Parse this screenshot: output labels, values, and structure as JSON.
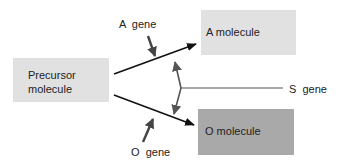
{
  "diagram": {
    "nodes": {
      "precursor": {
        "line1": "Precursor",
        "line2": "molecule",
        "fill": "#e1e1e1"
      },
      "a_molecule": {
        "label": "A molecule",
        "fill": "#e1e1e1"
      },
      "o_molecule": {
        "label": "O molecule",
        "fill": "#a9a9a9"
      }
    },
    "gene_labels": {
      "a_gene": "A  gene",
      "o_gene": "O  gene",
      "s_gene": "S  gene"
    },
    "edges": [
      {
        "from": "precursor",
        "to": "a_molecule",
        "modifier": "A gene"
      },
      {
        "from": "precursor",
        "to": "o_molecule",
        "modifier": "O gene"
      },
      {
        "from": "S gene",
        "to": "A pathway",
        "type": "influence"
      },
      {
        "from": "S gene",
        "to": "O pathway",
        "type": "influence"
      }
    ],
    "colors": {
      "main_arrow": "#111111",
      "gene_arrow": "#444444",
      "s_line": "#555555"
    }
  }
}
